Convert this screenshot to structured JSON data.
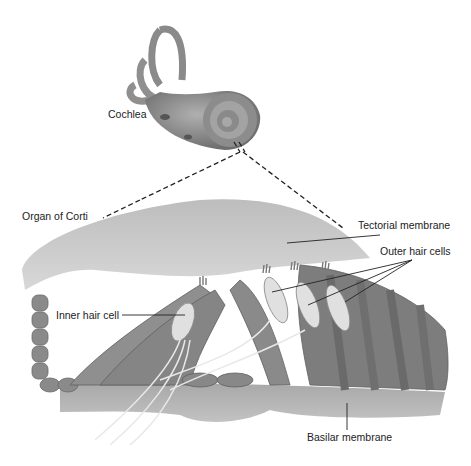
{
  "labels": {
    "cochlea": "Cochlea",
    "organ_of_corti": "Organ of Corti",
    "tectorial_membrane": "Tectorial membrane",
    "outer_hair_cells": "Outer hair cells",
    "inner_hair_cell": "Inner hair cell",
    "basilar_membrane": "Basilar membrane"
  },
  "colors": {
    "structure_dark": "#7a7a7a",
    "structure_mid": "#9a9a9a",
    "structure_light": "#c8c8c8",
    "hair_cell": "#dedede",
    "leader_line": "#222222"
  }
}
